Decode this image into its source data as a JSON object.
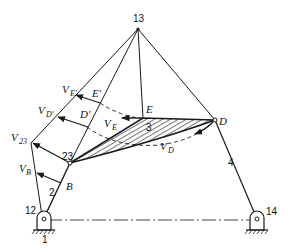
{
  "diagram": {
    "type": "mechanism velocity diagram (four-bar linkage, instant center 13)",
    "labels": {
      "ic13": "13",
      "ic12": "12",
      "ic14": "14",
      "ic23": "23",
      "ground": "1",
      "link2": "2",
      "link3": "3",
      "link4": "4",
      "pointB": "B",
      "pointD": "D",
      "pointE": "E",
      "pointEprime": "E'",
      "pointDprime": "D'",
      "vE": "V",
      "vE_sub": "E",
      "vD": "V",
      "vD_sub": "D",
      "vB": "V",
      "vB_sub": "B",
      "v23": "V",
      "v23_sub": "23",
      "vEprime": "V",
      "vEprime_sub": "E'",
      "vDprime": "V",
      "vDprime_sub": "D'"
    },
    "colors": {
      "line": "#1a1a1a",
      "background": "#ffffff"
    }
  }
}
